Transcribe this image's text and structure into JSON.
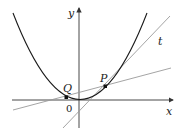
{
  "figure": {
    "axis_x_label": "x",
    "axis_y_label": "y",
    "origin_label": "0",
    "point_p_label": "P",
    "point_q_label": "Q",
    "tangent_label": "t",
    "colors": {
      "curve": "#1a1a1a",
      "lines": "#9a9a9a",
      "axes": "#333333"
    }
  }
}
